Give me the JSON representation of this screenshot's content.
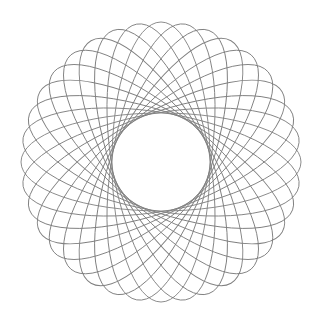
{
  "canvas": {
    "width": 323,
    "height": 323,
    "background_color": "#ffffff"
  },
  "figure": {
    "name": "spirograph-rosette",
    "center_x": 161,
    "center_y": 162,
    "stroke_color": "#808080",
    "stroke_width": 0.9,
    "fill": "none",
    "ellipse_count": 18,
    "rotation_step_degrees": 10,
    "semi_major_axis": 140,
    "semi_minor_axis": 49,
    "ellipse_center_offset": 0,
    "inner_envelope_radius": 42,
    "outer_extent_radius": 140
  },
  "chart_data": {
    "type": "line",
    "title": "",
    "subtitle": "",
    "xlabel": "",
    "ylabel": "",
    "grid": false,
    "legend": null,
    "xlim": [
      0,
      323
    ],
    "ylim": [
      0,
      323
    ],
    "series": [
      {
        "name": "ellipse-00",
        "rotation_deg": 0,
        "rx": 140,
        "ry": 49,
        "cx": 161,
        "cy": 162
      },
      {
        "name": "ellipse-01",
        "rotation_deg": 10,
        "rx": 140,
        "ry": 49,
        "cx": 161,
        "cy": 162
      },
      {
        "name": "ellipse-02",
        "rotation_deg": 20,
        "rx": 140,
        "ry": 49,
        "cx": 161,
        "cy": 162
      },
      {
        "name": "ellipse-03",
        "rotation_deg": 30,
        "rx": 140,
        "ry": 49,
        "cx": 161,
        "cy": 162
      },
      {
        "name": "ellipse-04",
        "rotation_deg": 40,
        "rx": 140,
        "ry": 49,
        "cx": 161,
        "cy": 162
      },
      {
        "name": "ellipse-05",
        "rotation_deg": 50,
        "rx": 140,
        "ry": 49,
        "cx": 161,
        "cy": 162
      },
      {
        "name": "ellipse-06",
        "rotation_deg": 60,
        "rx": 140,
        "ry": 49,
        "cx": 161,
        "cy": 162
      },
      {
        "name": "ellipse-07",
        "rotation_deg": 70,
        "rx": 140,
        "ry": 49,
        "cx": 161,
        "cy": 162
      },
      {
        "name": "ellipse-08",
        "rotation_deg": 80,
        "rx": 140,
        "ry": 49,
        "cx": 161,
        "cy": 162
      },
      {
        "name": "ellipse-09",
        "rotation_deg": 90,
        "rx": 140,
        "ry": 49,
        "cx": 161,
        "cy": 162
      },
      {
        "name": "ellipse-10",
        "rotation_deg": 100,
        "rx": 140,
        "ry": 49,
        "cx": 161,
        "cy": 162
      },
      {
        "name": "ellipse-11",
        "rotation_deg": 110,
        "rx": 140,
        "ry": 49,
        "cx": 161,
        "cy": 162
      },
      {
        "name": "ellipse-12",
        "rotation_deg": 120,
        "rx": 140,
        "ry": 49,
        "cx": 161,
        "cy": 162
      },
      {
        "name": "ellipse-13",
        "rotation_deg": 130,
        "rx": 140,
        "ry": 49,
        "cx": 161,
        "cy": 162
      },
      {
        "name": "ellipse-14",
        "rotation_deg": 140,
        "rx": 140,
        "ry": 49,
        "cx": 161,
        "cy": 162
      },
      {
        "name": "ellipse-15",
        "rotation_deg": 150,
        "rx": 140,
        "ry": 49,
        "cx": 161,
        "cy": 162
      },
      {
        "name": "ellipse-16",
        "rotation_deg": 160,
        "rx": 140,
        "ry": 49,
        "cx": 161,
        "cy": 162
      },
      {
        "name": "ellipse-17",
        "rotation_deg": 170,
        "rx": 140,
        "ry": 49,
        "cx": 161,
        "cy": 162
      }
    ]
  }
}
